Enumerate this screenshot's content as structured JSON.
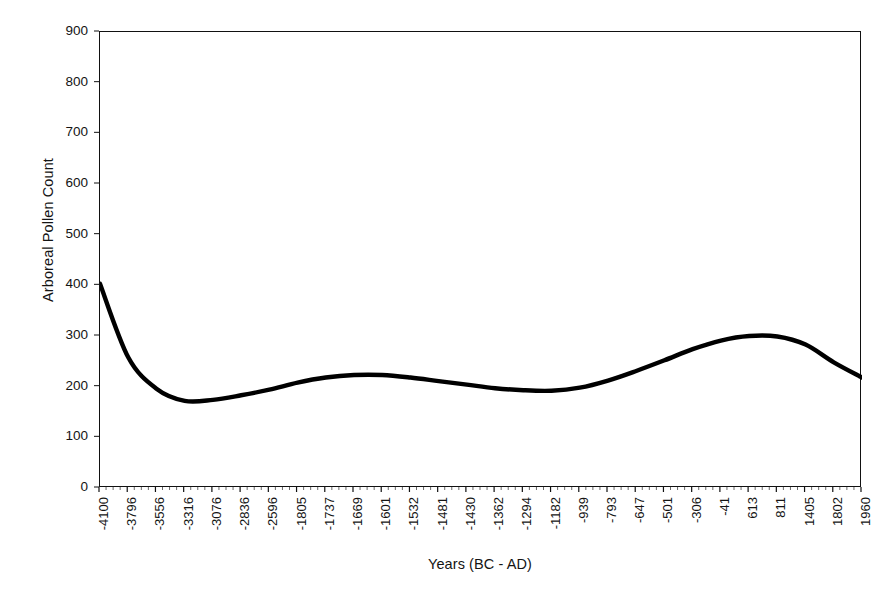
{
  "chart_data": {
    "type": "line",
    "title": "",
    "xlabel": "Years (BC - AD)",
    "ylabel": "Arboreal Pollen Count",
    "ylim": [
      0,
      900
    ],
    "y_ticks": [
      900,
      800,
      700,
      600,
      500,
      400,
      300,
      200,
      100,
      0
    ],
    "grid": false,
    "legend": "none",
    "line_color": "#000000",
    "line_width": 4,
    "categories": [
      "-4100",
      "-3796",
      "-3556",
      "-3316",
      "-3076",
      "-2836",
      "-2596",
      "-1805",
      "-1737",
      "-1669",
      "-1601",
      "-1532",
      "-1481",
      "-1430",
      "-1362",
      "-1294",
      "-1182",
      "-939",
      "-793",
      "-647",
      "-501",
      "-306",
      "-41",
      "613",
      "811",
      "1405",
      "1802",
      "1960"
    ],
    "values": [
      403,
      258,
      196,
      172,
      174,
      183,
      194,
      208,
      218,
      223,
      223,
      218,
      211,
      204,
      197,
      193,
      192,
      198,
      212,
      231,
      252,
      274,
      291,
      300,
      299,
      283,
      248,
      218
    ]
  },
  "axes": {
    "y_title": "Arboreal Pollen Count",
    "x_title": "Years (BC - AD)"
  }
}
